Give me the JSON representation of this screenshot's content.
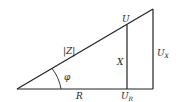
{
  "diagram": {
    "labels": {
      "hypotenuse": "|Z|",
      "angle": "φ",
      "base": "R",
      "inner_vertical": "X",
      "inner_top": "U",
      "base_bottom_main": "U",
      "base_bottom_sub": "R",
      "outer_vertical_main": "U",
      "outer_vertical_sub": "X"
    },
    "colors": {
      "line": "#222222",
      "background": "#ffffff"
    }
  }
}
